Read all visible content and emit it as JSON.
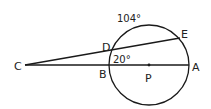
{
  "diagram": {
    "type": "circle-secant-geometry",
    "colors": {
      "stroke": "#1a1a1a",
      "text": "#222222",
      "background": "#ffffff"
    },
    "circle": {
      "center_label": "P"
    },
    "points": {
      "C": "C",
      "D": "D",
      "E": "E",
      "B": "B",
      "A": "A",
      "P": "P"
    },
    "arc_measure": "104°",
    "angle_measure": "20°",
    "segments": [
      "CE (secant through D)",
      "CA (secant through B, P)"
    ]
  }
}
